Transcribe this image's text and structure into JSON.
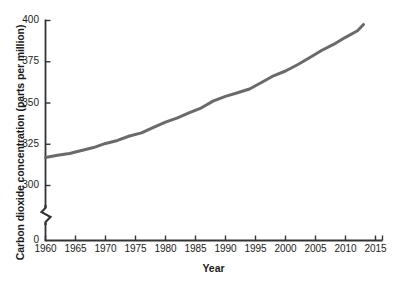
{
  "chart_data": {
    "type": "line",
    "title": "",
    "xlabel": "Year",
    "ylabel": "Carbon dioxide concentration (parts per million)",
    "xlim": [
      1960,
      2017
    ],
    "ylim": [
      300,
      400
    ],
    "y_axis_break": true,
    "y_break_note": "zigzag break between 0 and 300",
    "grid": false,
    "legend": null,
    "xticks": [
      1960,
      1965,
      1970,
      1975,
      1980,
      1985,
      1990,
      1995,
      2000,
      2005,
      2010,
      2015
    ],
    "xtick_labels": [
      "1960",
      "1965",
      "1970",
      "1975",
      "1980",
      "1985",
      "1990",
      "1995",
      "2000",
      "2005",
      "2010",
      "2015"
    ],
    "yticks": [
      0,
      300,
      325,
      350,
      375,
      400
    ],
    "ytick_labels": [
      "0",
      "300",
      "325",
      "350",
      "375",
      "400"
    ],
    "series": [
      {
        "name": "Atmospheric CO2",
        "color": "#6a6a6a",
        "x": [
          1960,
          1962,
          1964,
          1966,
          1968,
          1970,
          1972,
          1974,
          1976,
          1978,
          1980,
          1982,
          1984,
          1986,
          1988,
          1990,
          1992,
          1994,
          1996,
          1998,
          2000,
          2002,
          2004,
          2006,
          2008,
          2010,
          2012,
          2013
        ],
        "values": [
          317.0,
          318.3,
          319.4,
          321.2,
          323.0,
          325.5,
          327.3,
          330.0,
          331.9,
          335.2,
          338.4,
          341.0,
          344.2,
          347.1,
          351.3,
          354.0,
          356.2,
          358.5,
          362.4,
          366.5,
          369.4,
          373.2,
          377.4,
          381.8,
          385.5,
          389.8,
          393.8,
          397.6
        ]
      }
    ]
  },
  "axes": {
    "y_break_symbol": "zigzag"
  }
}
